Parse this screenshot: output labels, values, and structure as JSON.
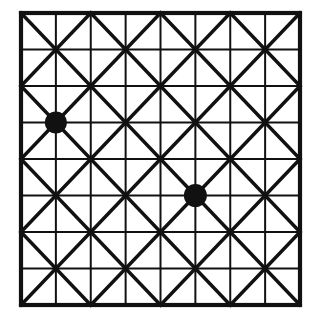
{
  "figure": {
    "title": "Square lattice with diagonals and two marked nodes",
    "type": "diagram",
    "caption": "",
    "background_color": "#ffffff",
    "line_color": "#111111",
    "marker_color": "#111111"
  },
  "canvas": {
    "width": 316,
    "height": 328
  },
  "lattice": {
    "origin_x": 21,
    "origin_y": 13,
    "step_x": 34.875,
    "step_y": 36.5,
    "cols": 8,
    "rows": 8,
    "node_count": 81,
    "border_stroke": 4.2,
    "grid_stroke": 2.0,
    "diagonal_stroke": 3.4,
    "major_every": 2
  },
  "structure": {
    "outer_square_label": "outer-border",
    "major_cells": "4 by 4",
    "minor_cells": "8 by 8",
    "description": "Each major cell is split into four minor squares; diagonals are drawn across every minor square forming an eight-point star at each major node."
  },
  "diagonals": {
    "note": "Diagonals are drawn on the minor grid so that every minor square carries exactly one diagonal, alternating direction in a checkerboard so that stars form at even-index nodes.",
    "down_right_color": "#111111",
    "down_left_color": "#111111"
  },
  "markers": [
    {
      "id": "marker-a",
      "label": "node-1-3",
      "col": 1,
      "row": 3,
      "cx": 55.9,
      "cy": 122.5,
      "radius": 11.0,
      "fill": "#111111"
    },
    {
      "id": "marker-b",
      "label": "node-5-5",
      "col": 5,
      "row": 5,
      "cx": 195.4,
      "cy": 195.5,
      "radius": 11.5,
      "fill": "#111111"
    }
  ],
  "chart_data": {
    "type": "scatter",
    "title": "Square lattice with diagonals and two marked nodes",
    "xlabel": "",
    "ylabel": "",
    "xlim": [
      0,
      8
    ],
    "ylim": [
      0,
      8
    ],
    "grid": true,
    "legend": "none",
    "categories": [
      "marked node"
    ],
    "series": [
      {
        "name": "marked node",
        "x": [
          1,
          5
        ],
        "y": [
          3,
          5
        ],
        "values": [
          1,
          1
        ]
      }
    ],
    "annotations": [
      "8 x 8 minor grid",
      "4 x 4 major grid",
      "diagonals across every minor square"
    ]
  }
}
